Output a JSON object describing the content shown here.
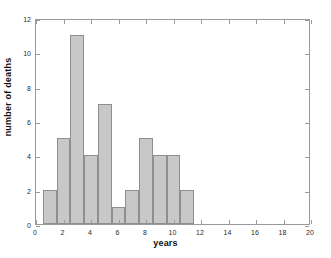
{
  "chart_data": {
    "type": "bar",
    "title": "",
    "subtitle": "",
    "xlabel": "years",
    "ylabel": "number of deaths",
    "xlim": [
      0,
      20
    ],
    "ylim": [
      0,
      12
    ],
    "xticks": [
      0,
      2,
      4,
      6,
      8,
      10,
      12,
      14,
      16,
      18,
      20
    ],
    "xtick_labels": [
      "0",
      "2",
      "4",
      "6",
      "8",
      "10",
      "12",
      "14",
      "16",
      "18",
      "20"
    ],
    "yticks": [
      0,
      2,
      4,
      6,
      8,
      10,
      12
    ],
    "ytick_labels": [
      "0",
      "2",
      "4",
      "6",
      "8",
      "10",
      "12"
    ],
    "grid": false,
    "legend": null,
    "bin_width": 1,
    "bin_edges": [
      0.5,
      1.5,
      2.5,
      3.5,
      4.5,
      5.5,
      6.5,
      7.5,
      8.5,
      9.5,
      10.5,
      11.5
    ],
    "categories": [
      "1",
      "2",
      "3",
      "4",
      "5",
      "6",
      "7",
      "8",
      "9",
      "10",
      "11"
    ],
    "x": [
      1,
      2,
      3,
      4,
      5,
      6,
      7,
      8,
      9,
      10,
      11
    ],
    "values": [
      2,
      5,
      11,
      4,
      7,
      1,
      2,
      5,
      4,
      4,
      2
    ],
    "bar_fill_color": "#c8c8c8",
    "bar_edge_color": "#8f8f8f",
    "axes_color": "#9a9a9a",
    "text_color": "#111111",
    "background_color": "#ffffff"
  }
}
